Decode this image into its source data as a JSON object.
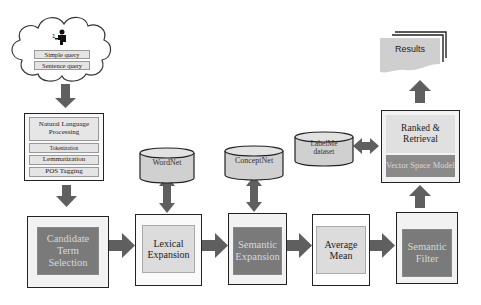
{
  "diagram": {
    "query_cloud": {
      "icon": "user-at-desk-icon",
      "items": [
        "Simple query",
        "Sentence query"
      ]
    },
    "nlp_block": {
      "title": "Natural Language Processing",
      "steps": [
        "Tokenization",
        "Lemmatization",
        "POS Tagging"
      ]
    },
    "pipeline": [
      {
        "id": "candidate",
        "label": "Candidate Term Selection",
        "style": "dark"
      },
      {
        "id": "lexical",
        "label": "Lexical Expansion",
        "style": "light"
      },
      {
        "id": "semantic_expansion",
        "label": "Semantic Expansion",
        "style": "dark"
      },
      {
        "id": "average",
        "label": "Average Mean",
        "style": "light"
      },
      {
        "id": "semantic_filter",
        "label": "Semantic Filter",
        "style": "dark"
      }
    ],
    "databases": [
      {
        "id": "wordnet",
        "label": "WordNet"
      },
      {
        "id": "conceptnet",
        "label": "ConceptNet"
      },
      {
        "id": "labelme",
        "label": "LabelMe dataset"
      }
    ],
    "ranking_block": {
      "title": "Ranked & Retrieval",
      "model": "Vector Space Model"
    },
    "results": {
      "label": "Results"
    },
    "colors": {
      "arrow": "#5f5f5f",
      "dark_box": "#7a7a7a",
      "light_box": "#dcdcdc",
      "outer_box": "#f2f2f2",
      "border": "#222222"
    }
  }
}
